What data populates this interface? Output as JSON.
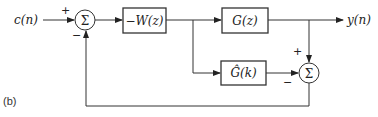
{
  "figure": {
    "label": "(b)",
    "input_label": "c(n)",
    "output_label": "y(n)",
    "summer1": {
      "symbol": "Σ",
      "plus_sign": "+",
      "minus_sign": "−"
    },
    "summer2": {
      "symbol": "Σ",
      "plus_sign": "+",
      "minus_sign": "−"
    },
    "blocks": {
      "controller": "−W(z)",
      "plant": "G(z)",
      "model": "Ĝ(k)"
    },
    "colors": {
      "line": "#333333",
      "text": "#222222",
      "background": "#ffffff"
    }
  }
}
